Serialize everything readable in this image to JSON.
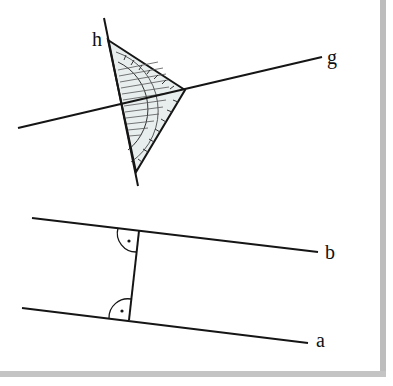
{
  "figure": {
    "top": {
      "description": "Set square (Geodreieck) placed on line h, used to construct a perpendicular to line g",
      "lines": [
        {
          "label": "h",
          "x1": 104,
          "y1": 18,
          "x2": 138,
          "y2": 186
        },
        {
          "label": "g",
          "x1": 18,
          "y1": 128,
          "x2": 322,
          "y2": 57
        }
      ],
      "set_square": {
        "vertices": [
          [
            108,
            40
          ],
          [
            185,
            90
          ],
          [
            136,
            172
          ]
        ],
        "fill": "#e6ecec"
      },
      "labels": [
        {
          "id": "h",
          "text": "h",
          "x": 92,
          "y": 46
        },
        {
          "id": "g",
          "text": "g",
          "x": 327,
          "y": 64
        }
      ]
    },
    "bottom": {
      "description": "Two parallel lines a and b with a common perpendicular and right-angle markers",
      "lines": [
        {
          "label": "b",
          "x1": 32,
          "y1": 218,
          "x2": 318,
          "y2": 252
        },
        {
          "label": "a",
          "x1": 22,
          "y1": 308,
          "x2": 308,
          "y2": 343
        },
        {
          "label": "perpendicular",
          "x1": 139,
          "y1": 231,
          "x2": 129,
          "y2": 320
        }
      ],
      "right_angle_markers": [
        {
          "at": "b",
          "x": 139,
          "y": 231
        },
        {
          "at": "a",
          "x": 129,
          "y": 320
        }
      ],
      "labels": [
        {
          "id": "b",
          "text": "b",
          "x": 325,
          "y": 259
        },
        {
          "id": "a",
          "text": "a",
          "x": 316,
          "y": 347
        }
      ]
    }
  },
  "colors": {
    "line": "#151515",
    "frame": "#bdbdbd",
    "set_square_fill": "#e6ecec"
  }
}
